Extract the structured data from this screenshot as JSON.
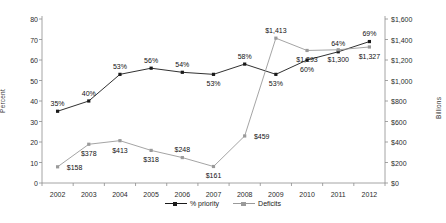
{
  "chart_data": {
    "type": "line",
    "title": "",
    "xlabel": "",
    "categories": [
      "2002",
      "2003",
      "2004",
      "2005",
      "2006",
      "2007",
      "2008",
      "2009",
      "2010",
      "2011",
      "2012"
    ],
    "grid": false,
    "legend_position": "bottom",
    "axes": {
      "left": {
        "label": "Percent",
        "ticks": [
          "0",
          "10",
          "20",
          "30",
          "40",
          "50",
          "60",
          "70",
          "80"
        ],
        "values": [
          0,
          10,
          20,
          30,
          40,
          50,
          60,
          70,
          80
        ],
        "ylim": [
          0,
          80
        ]
      },
      "right": {
        "label": "Billions",
        "ticks": [
          "$0",
          "$200",
          "$400",
          "$600",
          "$800",
          "$1,000",
          "$1,200",
          "$1,400",
          "$1,600"
        ],
        "values": [
          0,
          200,
          400,
          600,
          800,
          1000,
          1200,
          1400,
          1600
        ],
        "ylim": [
          0,
          1600
        ]
      }
    },
    "series": [
      {
        "name": "% priority",
        "axis": "left",
        "color": "#1a1a1a",
        "marker": "square",
        "values": [
          35,
          40,
          53,
          56,
          54,
          53,
          58,
          53,
          60,
          64,
          69
        ],
        "labels": [
          "35%",
          "40%",
          "53%",
          "56%",
          "54%",
          "53%",
          "58%",
          "53%",
          "60%",
          "64%",
          "69%"
        ],
        "label_positions": [
          "above",
          "above",
          "above",
          "above",
          "above",
          "below",
          "above",
          "below",
          "below",
          "above",
          "above"
        ]
      },
      {
        "name": "Deficits",
        "axis": "right",
        "color": "#9a9a9a",
        "marker": "square",
        "values": [
          158,
          378,
          413,
          318,
          248,
          161,
          459,
          1413,
          1293,
          1300,
          1327
        ],
        "labels": [
          "$158",
          "$378",
          "$413",
          "$318",
          "$248",
          "$161",
          "$459",
          "$1,413",
          "$1,293",
          "$1,300",
          "$1,327"
        ],
        "label_positions": [
          "right",
          "below",
          "below",
          "below",
          "above",
          "below",
          "right",
          "above",
          "below",
          "below",
          "below"
        ]
      }
    ],
    "legend": [
      {
        "label": "% priority",
        "color": "#1a1a1a"
      },
      {
        "label": "Deficits",
        "color": "#9a9a9a"
      }
    ]
  }
}
